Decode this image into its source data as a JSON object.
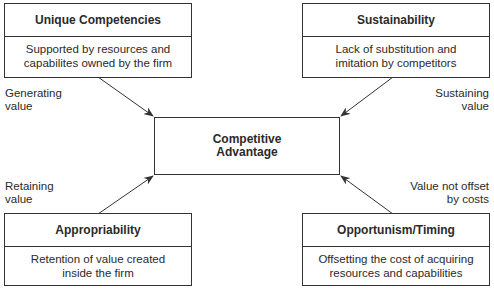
{
  "diagram": {
    "center": {
      "line1": "Competitive",
      "line2": "Advantage"
    },
    "boxes": [
      {
        "title": "Unique Competencies",
        "desc1": "Supported by resources and",
        "desc2": "capabilites owned by the firm"
      },
      {
        "title": "Sustainability",
        "desc1": "Lack of substitution and",
        "desc2": "imitation by competitors"
      },
      {
        "title": "Appropriability",
        "desc1": "Retention of value created",
        "desc2": "inside the firm"
      },
      {
        "title": "Opportunism/Timing",
        "desc1": "Offsetting the cost of acquiring",
        "desc2": "resources and capabilities"
      }
    ],
    "edge_labels": [
      {
        "line1": "Generating",
        "line2": "value"
      },
      {
        "line1": "Sustaining",
        "line2": "value"
      },
      {
        "line1": "Retaining",
        "line2": "value"
      },
      {
        "line1": "Value not offset",
        "line2": "by costs"
      }
    ],
    "colors": {
      "line": "#333333",
      "text": "#2a2a2a",
      "background": "#ffffff"
    }
  }
}
